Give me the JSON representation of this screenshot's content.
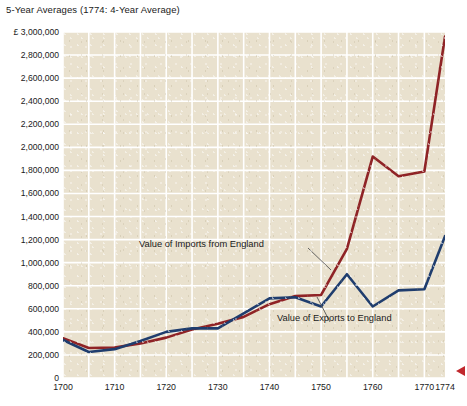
{
  "chart_data": {
    "type": "line",
    "title": "5-Year Averages (1774: 4-Year Average)",
    "xlabel": "",
    "ylabel": "",
    "currency_symbol": "£",
    "xlim": [
      1700,
      1774
    ],
    "ylim": [
      0,
      3000000
    ],
    "grid": true,
    "legend_position": "annotations-inline",
    "x": [
      1700,
      1705,
      1710,
      1715,
      1720,
      1725,
      1730,
      1735,
      1740,
      1745,
      1750,
      1755,
      1760,
      1765,
      1770,
      1774
    ],
    "y_tick_labels": [
      "£ 3,000,000",
      "2,800,000",
      "2,600,000",
      "2,400,000",
      "2,200,000",
      "2,000,000",
      "1,800,000",
      "1,600,000",
      "1,400,000",
      "1,200,000",
      "1,000,000",
      "800,000",
      "600,000",
      "400,000",
      "200,000",
      "0"
    ],
    "y_tick_values": [
      3000000,
      2800000,
      2600000,
      2400000,
      2200000,
      2000000,
      1800000,
      1600000,
      1400000,
      1200000,
      1000000,
      800000,
      600000,
      400000,
      200000,
      0
    ],
    "x_tick_labels": [
      "1700",
      "1710",
      "1720",
      "1730",
      "1740",
      "1750",
      "1760",
      "1770",
      "1774"
    ],
    "x_tick_values": [
      1700,
      1710,
      1720,
      1730,
      1740,
      1750,
      1760,
      1770,
      1774
    ],
    "series": [
      {
        "name": "Value of Imports from England",
        "color": "#8f2326",
        "values": [
          345000,
          260000,
          265000,
          300000,
          350000,
          420000,
          470000,
          530000,
          640000,
          710000,
          720000,
          1120000,
          1920000,
          1750000,
          1790000,
          2960000
        ]
      },
      {
        "name": "Value of Exports to England",
        "color": "#1f3d6e",
        "values": [
          330000,
          225000,
          250000,
          320000,
          400000,
          430000,
          430000,
          560000,
          690000,
          700000,
          620000,
          900000,
          620000,
          760000,
          770000,
          1230000
        ]
      }
    ],
    "annotations": [
      {
        "text": "Value of Imports from England",
        "target_series": "Value of Imports from England"
      },
      {
        "text": "Value of Exports to England",
        "target_series": "Value of Exports to England"
      }
    ]
  }
}
